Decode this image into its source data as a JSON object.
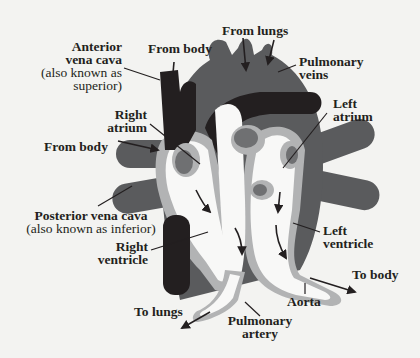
{
  "diagram": {
    "colors": {
      "background": "#f3f3f1",
      "deoxygenated_vessel": "#231f20",
      "heart_muscle": "#5a5b5d",
      "chamber_wall": "#b2b3b4",
      "chamber_interior": "#f8f8f7",
      "valve_inner": "#6f7072",
      "label_text": "#231f20"
    },
    "labels": {
      "anterior_vena_cava": {
        "line1": "Anterior",
        "line2": "vena cava",
        "line3": "(also known as",
        "line4": "superior)"
      },
      "from_body_top": "From body",
      "from_lungs": "From lungs",
      "pulmonary_veins": {
        "line1": "Pulmonary",
        "line2": "veins"
      },
      "right_atrium": {
        "line1": "Right",
        "line2": "atrium"
      },
      "left_atrium": {
        "line1": "Left",
        "line2": "atrium"
      },
      "from_body_side": "From body",
      "posterior_vena_cava": {
        "line1": "Posterior vena cava",
        "line2": "(also known as inferior)"
      },
      "right_ventricle": {
        "line1": "Right",
        "line2": "ventricle"
      },
      "left_ventricle": {
        "line1": "Left",
        "line2": "ventricle"
      },
      "to_body": "To body",
      "aorta": "Aorta",
      "to_lungs": "To lungs",
      "pulmonary_artery": {
        "line1": "Pulmonary",
        "line2": "artery"
      }
    }
  }
}
